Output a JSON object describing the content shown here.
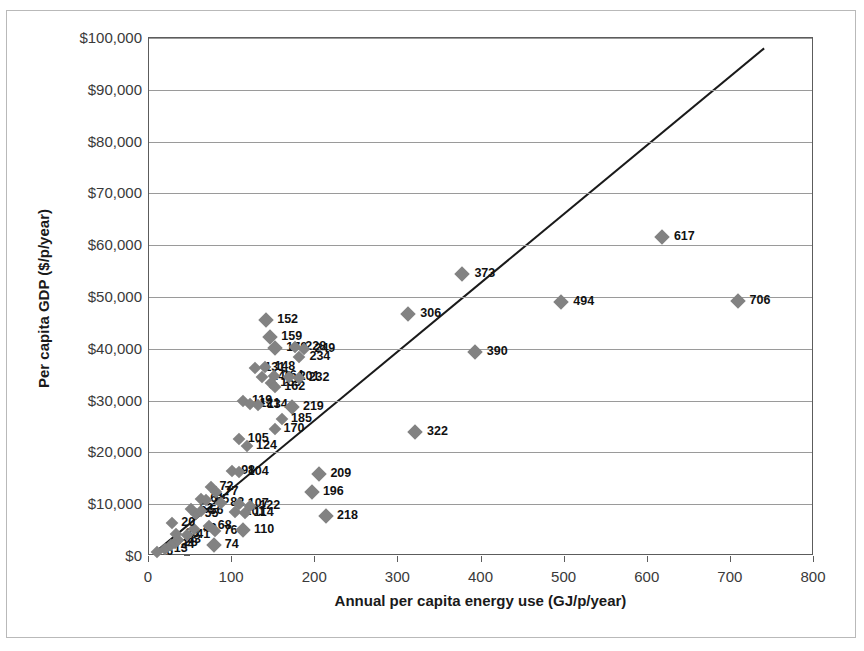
{
  "chart_data": {
    "type": "scatter",
    "title": "National GDP as a function of energy use",
    "xlabel": "Annual per capita energy use (GJ/p/year)",
    "ylabel": "Per capita GDP ($/p/year)",
    "xlim": [
      0,
      800
    ],
    "ylim": [
      0,
      100000
    ],
    "xticks": [
      "0",
      "100",
      "200",
      "300",
      "400",
      "500",
      "600",
      "700",
      "800"
    ],
    "xtick_values": [
      0,
      100,
      200,
      300,
      400,
      500,
      600,
      700,
      800
    ],
    "yticks": [
      "$0",
      "$10,000",
      "$20,000",
      "$30,000",
      "$40,000",
      "$50,000",
      "$60,000",
      "$70,000",
      "$80,000",
      "$90,000",
      "$100,000"
    ],
    "ytick_values": [
      0,
      10000,
      20000,
      30000,
      40000,
      50000,
      60000,
      70000,
      80000,
      90000,
      100000
    ],
    "grid": "horizontal",
    "legend": "none",
    "marker_shape": "diamond",
    "marker_color": "#828282",
    "trendline": {
      "type": "linear",
      "color": "#1a1a1a",
      "x_start": 8,
      "y_start": 800,
      "x_end": 740,
      "y_end": 98000
    },
    "points": [
      {
        "label": "6",
        "x": 10,
        "y": 700,
        "lx": 9,
        "ly": -1
      },
      {
        "label": "13",
        "x": 19,
        "y": 1300,
        "lx": 9,
        "ly": -1
      },
      {
        "label": "24",
        "x": 27,
        "y": 2200,
        "lx": 9,
        "ly": -1
      },
      {
        "label": "28",
        "x": 31,
        "y": 2600,
        "lx": 9,
        "ly": -1
      },
      {
        "label": "33",
        "x": 35,
        "y": 3100,
        "lx": 9,
        "ly": -1
      },
      {
        "label": "38",
        "x": 33,
        "y": 4300,
        "lx": 9,
        "ly": -1
      },
      {
        "label": "41",
        "x": 46,
        "y": 4000,
        "lx": 9,
        "ly": -1
      },
      {
        "label": "49",
        "x": 54,
        "y": 5200,
        "lx": 9,
        "ly": -1
      },
      {
        "label": "68",
        "x": 72,
        "y": 5700,
        "lx": 9,
        "ly": -1
      },
      {
        "label": "74",
        "x": 78,
        "y": 2100,
        "lx": 11,
        "ly": -1
      },
      {
        "label": "76",
        "x": 79,
        "y": 4900,
        "lx": 9,
        "ly": -1
      },
      {
        "label": "20",
        "x": 28,
        "y": 6400,
        "lx": 9,
        "ly": -1
      },
      {
        "label": "55",
        "x": 56,
        "y": 8200,
        "lx": 9,
        "ly": -1
      },
      {
        "label": "52",
        "x": 50,
        "y": 9100,
        "lx": 9,
        "ly": -1
      },
      {
        "label": "56",
        "x": 62,
        "y": 8600,
        "lx": 9,
        "ly": -1
      },
      {
        "label": "61",
        "x": 63,
        "y": 11000,
        "lx": 9,
        "ly": -1
      },
      {
        "label": "65",
        "x": 69,
        "y": 10800,
        "lx": 9,
        "ly": -1
      },
      {
        "label": "72",
        "x": 74,
        "y": 13400,
        "lx": 9,
        "ly": -1
      },
      {
        "label": "77",
        "x": 80,
        "y": 12400,
        "lx": 9,
        "ly": -1
      },
      {
        "label": "82",
        "x": 87,
        "y": 10300,
        "lx": 9,
        "ly": -1
      },
      {
        "label": "101",
        "x": 104,
        "y": 8400,
        "lx": 9,
        "ly": -1
      },
      {
        "label": "107",
        "x": 108,
        "y": 10100,
        "lx": 9,
        "ly": -1
      },
      {
        "label": "110",
        "x": 113,
        "y": 5000,
        "lx": 11,
        "ly": -1
      },
      {
        "label": "114",
        "x": 115,
        "y": 8300,
        "lx": 9,
        "ly": -1
      },
      {
        "label": "122",
        "x": 122,
        "y": 9600,
        "lx": 9,
        "ly": -1
      },
      {
        "label": "98",
        "x": 100,
        "y": 16400,
        "lx": 9,
        "ly": -1
      },
      {
        "label": "104",
        "x": 108,
        "y": 16300,
        "lx": 9,
        "ly": -1
      },
      {
        "label": "105",
        "x": 108,
        "y": 22600,
        "lx": 9,
        "ly": -1
      },
      {
        "label": "124",
        "x": 118,
        "y": 21300,
        "lx": 9,
        "ly": -1
      },
      {
        "label": "119",
        "x": 113,
        "y": 29900,
        "lx": 9,
        "ly": -1
      },
      {
        "label": "121",
        "x": 122,
        "y": 29300,
        "lx": 9,
        "ly": -1
      },
      {
        "label": "134",
        "x": 131,
        "y": 29100,
        "lx": 9,
        "ly": -1
      },
      {
        "label": "131",
        "x": 128,
        "y": 36200,
        "lx": 9,
        "ly": -1
      },
      {
        "label": "148",
        "x": 140,
        "y": 36400,
        "lx": 9,
        "ly": -1
      },
      {
        "label": "140",
        "x": 136,
        "y": 34500,
        "lx": 9,
        "ly": -1
      },
      {
        "label": "164",
        "x": 150,
        "y": 34700,
        "lx": 9,
        "ly": -1
      },
      {
        "label": "155",
        "x": 147,
        "y": 33400,
        "lx": 9,
        "ly": -1
      },
      {
        "label": "162",
        "x": 152,
        "y": 32600,
        "lx": 9,
        "ly": -1
      },
      {
        "label": "152",
        "x": 141,
        "y": 45500,
        "lx": 11,
        "ly": -1
      },
      {
        "label": "159",
        "x": 146,
        "y": 42300,
        "lx": 11,
        "ly": -1
      },
      {
        "label": "170",
        "x": 152,
        "y": 40200,
        "lx": 11,
        "ly": -1
      },
      {
        "label": "228",
        "x": 176,
        "y": 40300,
        "lx": 10,
        "ly": -1
      },
      {
        "label": "249",
        "x": 187,
        "y": 40000,
        "lx": 10,
        "ly": -1
      },
      {
        "label": "234",
        "x": 181,
        "y": 38500,
        "lx": 10,
        "ly": -1
      },
      {
        "label": "201",
        "x": 168,
        "y": 34600,
        "lx": 10,
        "ly": -1
      },
      {
        "label": "232",
        "x": 180,
        "y": 34400,
        "lx": 10,
        "ly": -1
      },
      {
        "label": "219",
        "x": 172,
        "y": 28800,
        "lx": 11,
        "ly": -1
      },
      {
        "label": "185",
        "x": 160,
        "y": 26400,
        "lx": 9,
        "ly": -1
      },
      {
        "label": "170",
        "x": 151,
        "y": 24500,
        "lx": 9,
        "ly": -1
      },
      {
        "label": "209",
        "x": 205,
        "y": 15800,
        "lx": 11,
        "ly": -1
      },
      {
        "label": "196",
        "x": 196,
        "y": 12400,
        "lx": 11,
        "ly": -1
      },
      {
        "label": "218",
        "x": 213,
        "y": 7700,
        "lx": 11,
        "ly": -1
      },
      {
        "label": "306",
        "x": 312,
        "y": 46800,
        "lx": 12,
        "ly": -1
      },
      {
        "label": "322",
        "x": 320,
        "y": 24000,
        "lx": 12,
        "ly": -1
      },
      {
        "label": "373",
        "x": 377,
        "y": 54500,
        "lx": 12,
        "ly": -1
      },
      {
        "label": "390",
        "x": 392,
        "y": 39400,
        "lx": 12,
        "ly": -1
      },
      {
        "label": "494",
        "x": 496,
        "y": 49000,
        "lx": 12,
        "ly": -1
      },
      {
        "label": "617",
        "x": 617,
        "y": 61500,
        "lx": 12,
        "ly": -1
      },
      {
        "label": "706",
        "x": 708,
        "y": 49300,
        "lx": 12,
        "ly": -1
      }
    ]
  }
}
